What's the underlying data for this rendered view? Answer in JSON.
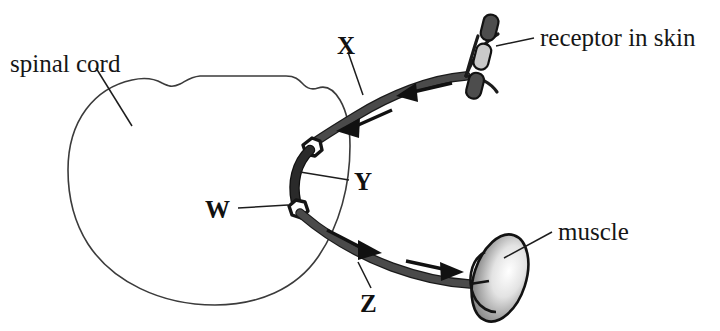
{
  "figure": {
    "type": "biology-diagram",
    "background_color": "#ffffff",
    "ink_color": "#161616"
  },
  "labels": {
    "spinal_cord": "spinal cord",
    "receptor_in_skin": "receptor in skin",
    "muscle": "muscle",
    "letter_x": "X",
    "letter_y": "Y",
    "letter_w": "W",
    "letter_z": "Z"
  },
  "structures": [
    {
      "key": "spinal-cord",
      "name": "spinal cord",
      "label": "spinal cord",
      "description": "large rounded outline at left with notched upper border",
      "stroke_color": "#3b3b3b",
      "fill_color": "#ffffff"
    },
    {
      "key": "sensory-neuron",
      "name": "sensory neuron",
      "label": "X",
      "description": "upper fiber running from receptor in skin to spinal cord, arrows point toward cord",
      "direction": "toward spinal cord",
      "stroke_color": "#4a4a4a"
    },
    {
      "key": "relay-neuron",
      "name": "relay neuron",
      "label": "Y",
      "description": "short dark segment inside the cord linking the two cell bodies",
      "stroke_color": "#2a2a2a"
    },
    {
      "key": "synapse",
      "name": "synapse",
      "label": "W",
      "description": "lower cell-body junction inside the spinal cord",
      "stroke_color": "#151515"
    },
    {
      "key": "motor-neuron",
      "name": "motor neuron",
      "label": "Z",
      "description": "lower fiber running from spinal cord to muscle, arrows point toward muscle",
      "direction": "toward muscle",
      "stroke_color": "#4a4a4a"
    },
    {
      "key": "receptor",
      "name": "receptor in skin",
      "label": "receptor in skin",
      "description": "segmented rod-shaped sensory ending at upper right",
      "fill_dark": "#4d4d4d",
      "fill_light": "#c9c9c9"
    },
    {
      "key": "muscle",
      "name": "muscle",
      "label": "muscle",
      "description": "shaded oval effector at lower right",
      "fill_gradient_from": "#6f6f6f",
      "fill_gradient_to": "#ffffff"
    }
  ],
  "flow_arrows": [
    {
      "on": "X",
      "direction": "left-down",
      "meaning": "impulse travels from receptor to spinal cord"
    },
    {
      "on": "X",
      "direction": "left-down",
      "meaning": "impulse travels from receptor to spinal cord"
    },
    {
      "on": "Z",
      "direction": "right-down",
      "meaning": "impulse travels from spinal cord to muscle"
    },
    {
      "on": "Z",
      "direction": "right-down",
      "meaning": "impulse travels from spinal cord to muscle"
    }
  ]
}
